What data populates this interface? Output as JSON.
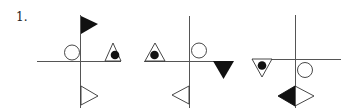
{
  "problem": {
    "number_label": "1."
  },
  "colors": {
    "line": "#555555",
    "shape_stroke": "#333333",
    "fill_black": "#111111",
    "fill_white": "#ffffff"
  },
  "figures": [
    {
      "name": "figure-1",
      "shapes": [
        {
          "type": "flag-triangle-right",
          "fill": "black",
          "position": "top of vertical axis"
        },
        {
          "type": "circle",
          "fill": "white",
          "position": "upper-left quadrant"
        },
        {
          "type": "triangle-up-with-dot",
          "fill": "white",
          "dot": "black",
          "position": "right end, above horizontal axis"
        },
        {
          "type": "triangle-right",
          "fill": "white",
          "position": "bottom of vertical axis"
        }
      ]
    },
    {
      "name": "figure-2",
      "shapes": [
        {
          "type": "triangle-up-with-dot",
          "fill": "white",
          "dot": "black",
          "position": "left end, above horizontal axis"
        },
        {
          "type": "circle",
          "fill": "white",
          "position": "upper-right quadrant"
        },
        {
          "type": "triangle-down",
          "fill": "black",
          "position": "right end, below horizontal axis"
        },
        {
          "type": "triangle-left",
          "fill": "white",
          "position": "bottom of vertical axis"
        }
      ]
    },
    {
      "name": "figure-3",
      "shapes": [
        {
          "type": "triangle-down-with-dot",
          "fill": "white",
          "dot": "black",
          "position": "left end, below horizontal axis"
        },
        {
          "type": "circle",
          "fill": "white",
          "position": "lower-right quadrant"
        },
        {
          "type": "diamond-half-black",
          "fill": "left black / right white",
          "position": "bottom of vertical axis"
        }
      ]
    }
  ]
}
